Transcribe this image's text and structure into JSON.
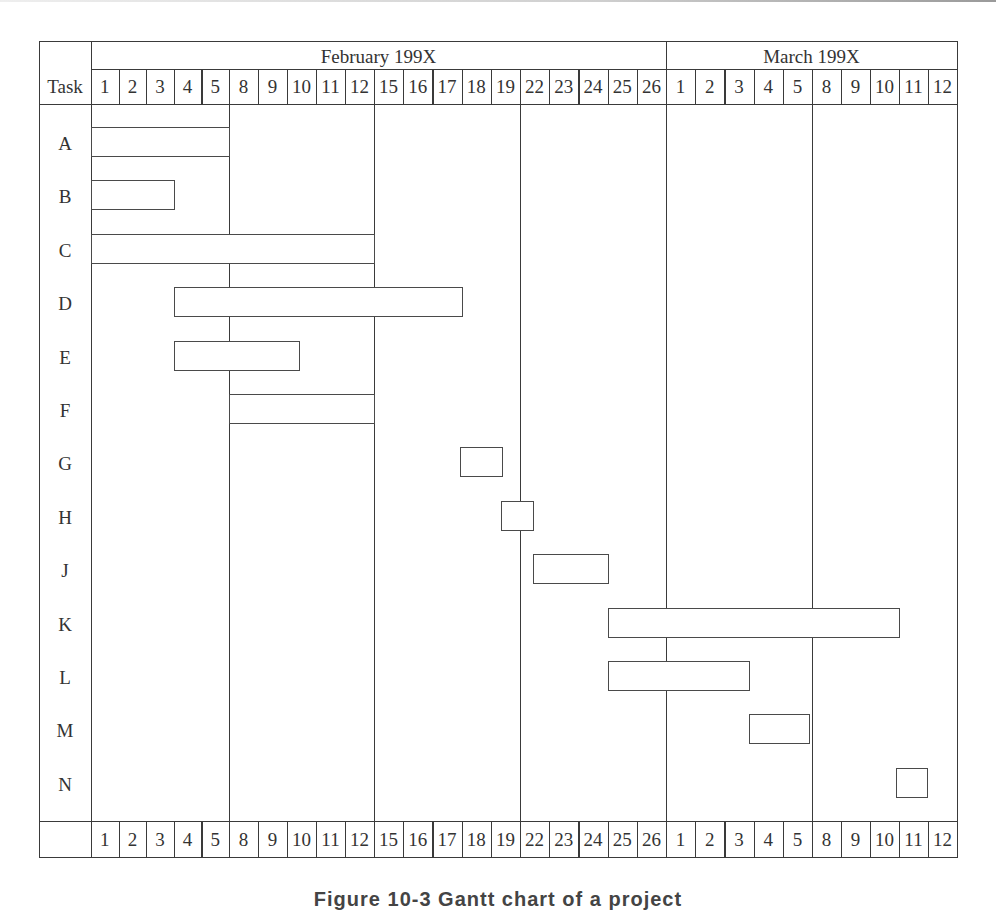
{
  "caption": "Figure 10-3  Gantt chart of a project",
  "colors": {
    "line": "#3a3a3a",
    "bar_border": "#4a4a4a",
    "bar_fill": "#ffffff",
    "text": "#333333"
  },
  "header": {
    "task_label": "Task",
    "months": [
      {
        "label": "February 199X",
        "start_col": 0,
        "end_col": 20
      },
      {
        "label": "March 199X",
        "start_col": 20,
        "end_col": 30
      }
    ],
    "days": [
      "1",
      "2",
      "3",
      "4",
      "5",
      "8",
      "9",
      "10",
      "11",
      "12",
      "15",
      "16",
      "17",
      "18",
      "19",
      "22",
      "23",
      "24",
      "25",
      "26",
      "1",
      "2",
      "3",
      "4",
      "5",
      "8",
      "9",
      "10",
      "11",
      "12"
    ]
  },
  "chart_data": {
    "type": "gantt",
    "title": "",
    "xlabel": "Working days (Feb 199X – Mar 199X)",
    "ylabel": "Task",
    "x_ticks": [
      "Feb 1",
      "Feb 2",
      "Feb 3",
      "Feb 4",
      "Feb 5",
      "Feb 8",
      "Feb 9",
      "Feb 10",
      "Feb 11",
      "Feb 12",
      "Feb 15",
      "Feb 16",
      "Feb 17",
      "Feb 18",
      "Feb 19",
      "Feb 22",
      "Feb 23",
      "Feb 24",
      "Feb 25",
      "Feb 26",
      "Mar 1",
      "Mar 2",
      "Mar 3",
      "Mar 4",
      "Mar 5",
      "Mar 8",
      "Mar 9",
      "Mar 10",
      "Mar 11",
      "Mar 12"
    ],
    "week_separators_after_col": [
      5,
      10,
      15,
      20,
      25
    ],
    "tasks": [
      {
        "task": "A",
        "start_col": 0,
        "end_col": 5,
        "start": "Feb 1",
        "end": "Feb 5"
      },
      {
        "task": "B",
        "start_col": 0,
        "end_col": 3,
        "start": "Feb 1",
        "end": "Feb 3"
      },
      {
        "task": "C",
        "start_col": 0,
        "end_col": 10,
        "start": "Feb 1",
        "end": "Feb 12"
      },
      {
        "task": "D",
        "start_col": 3,
        "end_col": 13,
        "start": "Feb 4",
        "end": "Feb 17"
      },
      {
        "task": "E",
        "start_col": 3,
        "end_col": 7.4,
        "start": "Feb 4",
        "end": "Feb 10 (mid)"
      },
      {
        "task": "F",
        "start_col": 5,
        "end_col": 10,
        "start": "Feb 8",
        "end": "Feb 12"
      },
      {
        "task": "G",
        "start_col": 12.95,
        "end_col": 14.4,
        "start": "Feb 18",
        "end": "Feb 19 (mid)"
      },
      {
        "task": "H",
        "start_col": 14.35,
        "end_col": 15.45,
        "start": "Feb 19 (mid)",
        "end": "Feb 22 (mid)"
      },
      {
        "task": "J",
        "start_col": 15.45,
        "end_col": 18,
        "start": "Feb 22 (mid)",
        "end": "Feb 24"
      },
      {
        "task": "K",
        "start_col": 18,
        "end_col": 28,
        "start": "Feb 25",
        "end": "Mar 10"
      },
      {
        "task": "L",
        "start_col": 18,
        "end_col": 22.85,
        "start": "Feb 25",
        "end": "Mar 3"
      },
      {
        "task": "M",
        "start_col": 22.85,
        "end_col": 24.9,
        "start": "Mar 4",
        "end": "Mar 5"
      },
      {
        "task": "N",
        "start_col": 27.9,
        "end_col": 28.97,
        "start": "Mar 11",
        "end": "Mar 11"
      }
    ]
  }
}
